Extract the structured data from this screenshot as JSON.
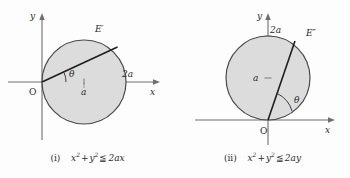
{
  "figure": {
    "background_color": "#fdfdfd",
    "stroke_color": "#2b2b2b",
    "axis_color": "#6e6e6e",
    "disk_fill_color": "#dcdcdc",
    "disk_stroke_color": "#4a4a4a"
  },
  "panels": [
    {
      "id": "i",
      "caption": {
        "index": "(i)",
        "expr_plain": "x² + y² ≦ 2ax",
        "lhs_var1": "x",
        "lhs_var2": "y",
        "exponent": "2",
        "plus": "+",
        "relation": "≦",
        "rhs": "2ax"
      },
      "labels": {
        "y_axis": "y",
        "x_axis": "x",
        "origin": "O",
        "curve": "E′",
        "angle": "θ",
        "center_distance": "a",
        "diameter": "2a"
      },
      "geometry": {
        "origin_px": [
          42,
          82
        ],
        "circle_center_px": [
          84,
          82
        ],
        "circle_radius_px": 42,
        "chord_end_px": [
          118,
          47
        ],
        "chord_angle_deg": 45
      }
    },
    {
      "id": "ii",
      "caption": {
        "index": "(ii)",
        "expr_plain": "x² + y² ≦ 2ay",
        "lhs_var1": "x",
        "lhs_var2": "y",
        "exponent": "2",
        "plus": "+",
        "relation": "≦",
        "rhs": "2ay"
      },
      "labels": {
        "y_axis": "y",
        "x_axis": "x",
        "origin": "O",
        "curve": "E″",
        "angle": "θ",
        "center_distance": "a",
        "diameter": "2a"
      },
      "geometry": {
        "origin_px": [
          93,
          120
        ],
        "circle_center_px": [
          93,
          78
        ],
        "circle_radius_px": 42,
        "chord_end_px": [
          120,
          41
        ],
        "chord_angle_deg": 72
      }
    }
  ]
}
